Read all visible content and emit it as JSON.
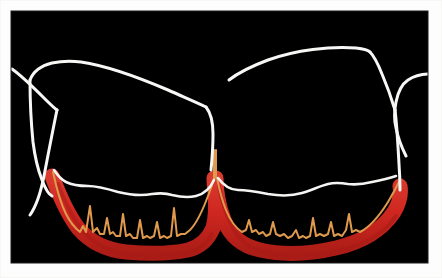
{
  "figure": {
    "kind": "dental-periodontal-line-tracing",
    "description": "Traced line illustration on black background of two adjacent tooth crowns with gingival margin, alveolar bone crest and inflamed gingival band",
    "canvas": {
      "width": 442,
      "height": 278,
      "matte_color": "#fdfdfd",
      "plate_color": "#000000",
      "plate_rect": {
        "x": 11,
        "y": 11,
        "width": 417,
        "height": 252
      }
    },
    "palette": {
      "background": "#000000",
      "matte": "#fdfdfd",
      "tooth_outline": "#f7f7f5",
      "gingival_margin": "#f4f4f2",
      "bone_crest": "#e09a4e",
      "inflamed_gingiva": "#cf2720",
      "inflamed_gingiva_shadow": "#a81b16"
    },
    "strokes": {
      "tooth_outline_width": 3.0,
      "gingival_margin_width": 2.6,
      "bone_crest_width": 2.0,
      "inflamed_band_width": 15.0
    },
    "layers": [
      {
        "name": "left-tooth-crown-outline",
        "color": "#f7f7f5",
        "label": "Left tooth crown outline"
      },
      {
        "name": "right-tooth-crown-outline",
        "color": "#f7f7f5",
        "label": "Right tooth crown outline"
      },
      {
        "name": "left-adjacent-tooth-edge",
        "color": "#f7f7f5",
        "label": "Left adjacent tooth edge"
      },
      {
        "name": "right-adjacent-tooth-edge",
        "color": "#f7f7f5",
        "label": "Right adjacent tooth edge"
      },
      {
        "name": "left-gingival-margin",
        "color": "#f4f4f2",
        "label": "Left gingival margin"
      },
      {
        "name": "right-gingival-margin",
        "color": "#f4f4f2",
        "label": "Right gingival margin"
      },
      {
        "name": "left-inflamed-gingiva-band",
        "color": "#cf2720",
        "label": "Left inflamed gingival band"
      },
      {
        "name": "right-inflamed-gingiva-band",
        "color": "#cf2720",
        "label": "Right inflamed gingival band"
      },
      {
        "name": "left-alveolar-bone-crest",
        "color": "#e09a4e",
        "label": "Left alveolar bone crest"
      },
      {
        "name": "right-alveolar-bone-crest",
        "color": "#e09a4e",
        "label": "Right alveolar bone crest"
      },
      {
        "name": "interdental-papilla-peak",
        "color": "#e09a4e",
        "label": "Interdental papilla peak"
      }
    ],
    "geometry": {
      "left_crown": "M 30 80 C 33 72 40 66 52 63 C 62 61 72 61 81 62 C 108 66 140 78 168 90 C 186 98 198 103 206 107",
      "left_crown_lower": "M 206 107 C 210 112 213 122 213 134 C 213 148 212 160 211 170",
      "left_tooth_left_side": "M 30 80 C 30 98 31 122 33 142 C 35 158 38 170 42 180 C 45 188 48 194 52 196",
      "left_adjacent_edge": "M 12 69 C 22 76 34 88 44 98 C 50 104 54 108 57 110",
      "left_adjacent_edge_lower": "M 57 110 C 54 124 49 150 44 176 C 40 196 35 208 30 215",
      "right_crown": "M 229 80 C 238 73 252 66 268 60 C 296 50 330 46 356 48 C 364 49 368 50 370 52",
      "right_crown_top": "M 370 52 C 374 56 378 64 382 74 C 388 88 392 100 395 110",
      "right_crown_right": "M 395 110 C 397 126 398 146 399 164 C 400 178 400 186 400 190",
      "right_tooth_left_side": "M 229 80 C 227 96 226 116 225 134 C 224 150 223 162 222 170",
      "right_adjacent_edge": "M 430 74 C 422 74 414 76 408 80 C 402 84 398 92 396 102 C 394 112 394 120 396 128 C 398 138 402 148 406 156",
      "left_gum_margin": "M 54 170 C 58 176 62 180 66 182 C 72 185 80 186 88 186 C 98 186 108 189 118 192 C 130 195 142 196 152 194 C 160 193 166 193 172 195 C 180 197 188 198 196 196 C 204 194 210 189 214 180",
      "right_gum_margin": "M 218 178 C 224 186 230 190 238 190 C 248 190 258 192 268 194 C 280 196 292 196 302 193 C 312 190 320 186 328 184 C 336 182 342 183 348 184 C 356 185 364 184 372 182 C 382 180 390 178 396 176",
      "left_red_band": "M 52 176 C 58 192 66 212 78 228 C 90 242 106 250 126 252 C 148 254 170 254 188 250 C 200 247 208 240 213 228 C 216 218 216 204 215 190 C 214 184 214 180 214 178",
      "right_red_band": "M 216 178 C 216 188 218 204 224 220 C 230 236 242 246 260 250 C 282 255 310 254 336 248 C 362 242 382 230 394 212 C 400 202 401 192 400 186",
      "left_bone_crest": "M 53 172 C 56 186 60 202 66 214 C 70 222 75 228 80 232 L 83 226 L 86 232 L 90 206 L 93 232 L 97 228 L 100 234 L 104 234 L 107 218 L 110 234 L 113 232 L 116 236 L 120 236 L 123 214 L 126 236 L 130 234 L 133 238 L 137 238 L 140 220 L 143 238 L 147 236 L 150 238 L 154 236 L 157 222 L 160 238 L 164 236 L 167 238 L 171 236 L 174 208 L 177 236 L 181 234 L 185 234 L 190 230 C 196 224 202 212 208 196 C 211 188 213 182 214 178",
      "right_bone_crest": "M 217 178 C 219 188 222 200 226 210 C 230 220 236 228 242 232 L 246 230 L 249 220 L 252 232 L 256 230 L 259 234 L 263 232 L 266 236 L 270 234 L 273 222 L 276 234 L 280 236 L 284 234 L 288 238 L 292 236 L 296 230 L 299 238 L 303 236 L 306 238 L 310 236 L 313 218 L 316 236 L 320 234 L 324 236 L 328 234 L 331 222 L 334 236 L 338 234 L 342 236 L 346 230 L 349 214 L 352 232 L 356 230 L 360 232 C 368 228 378 218 388 202 C 394 192 398 184 400 180",
      "papilla_peak_left": "M 214 178 C 214 166 214 156 214 150",
      "papilla_peak_right": "M 216 178 C 216 166 216 156 216 150"
    }
  }
}
